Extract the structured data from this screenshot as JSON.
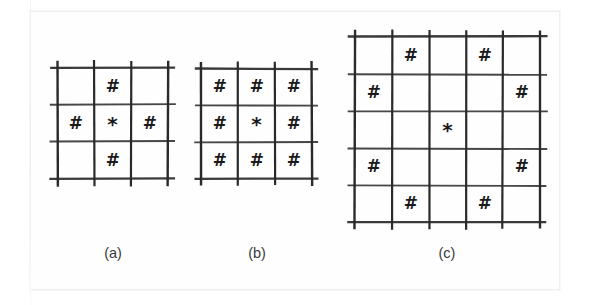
{
  "figure": {
    "background_color": "#ffffff",
    "sheet_color": "#fefefe",
    "line_color": "#2a2a2a",
    "mark_color": "#1b1b1b",
    "symbols": {
      "neighbor": "#",
      "center": "*",
      "empty": ""
    },
    "panels": [
      {
        "id": "panel-a",
        "caption": "(a)",
        "rows": 3,
        "cols": 3,
        "cell_size": 37,
        "origin_x": 57,
        "origin_y": 68,
        "caption_x": 113,
        "caption_y": 245,
        "grid": [
          [
            "",
            "#",
            ""
          ],
          [
            "#",
            "*",
            "#"
          ],
          [
            "",
            "#",
            ""
          ]
        ]
      },
      {
        "id": "panel-b",
        "caption": "(b)",
        "rows": 3,
        "cols": 3,
        "cell_size": 37,
        "origin_x": 201,
        "origin_y": 68,
        "caption_x": 257,
        "caption_y": 245,
        "grid": [
          [
            "#",
            "#",
            "#"
          ],
          [
            "#",
            "*",
            "#"
          ],
          [
            "#",
            "#",
            "#"
          ]
        ]
      },
      {
        "id": "panel-c",
        "caption": "(c)",
        "rows": 5,
        "cols": 5,
        "cell_size": 37,
        "origin_x": 355,
        "origin_y": 37,
        "caption_x": 447,
        "caption_y": 245,
        "grid": [
          [
            "",
            "#",
            "",
            "#",
            ""
          ],
          [
            "#",
            "",
            "",
            "",
            "#"
          ],
          [
            "",
            "",
            "*",
            "",
            ""
          ],
          [
            "#",
            "",
            "",
            "",
            "#"
          ],
          [
            "",
            "#",
            "",
            "#",
            ""
          ]
        ]
      }
    ]
  }
}
